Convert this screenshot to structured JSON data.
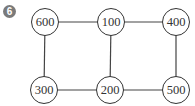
{
  "problem": {
    "number": "6",
    "badge_color": "#7a7a7a"
  },
  "graph": {
    "nodes": [
      {
        "id": "n600",
        "label": "600",
        "x": 45,
        "y": 22
      },
      {
        "id": "n100",
        "label": "100",
        "x": 111,
        "y": 22
      },
      {
        "id": "n400",
        "label": "400",
        "x": 176,
        "y": 22
      },
      {
        "id": "n300",
        "label": "300",
        "x": 44,
        "y": 90
      },
      {
        "id": "n200",
        "label": "200",
        "x": 110,
        "y": 90
      },
      {
        "id": "n500",
        "label": "500",
        "x": 176,
        "y": 90
      }
    ],
    "edges": [
      [
        "600",
        "100"
      ],
      [
        "100",
        "400"
      ],
      [
        "600",
        "300"
      ],
      [
        "100",
        "200"
      ],
      [
        "400",
        "500"
      ],
      [
        "300",
        "200"
      ],
      [
        "200",
        "500"
      ]
    ]
  }
}
